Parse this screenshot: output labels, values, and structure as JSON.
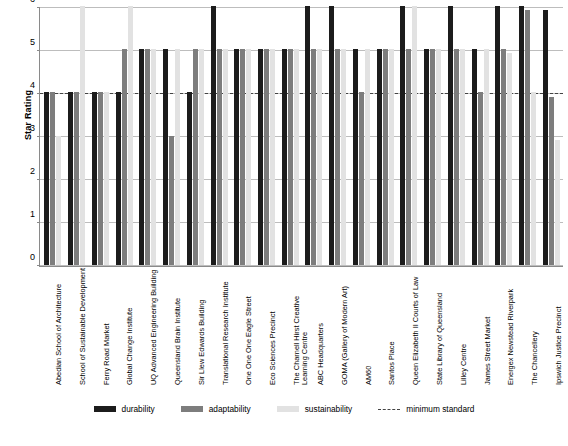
{
  "chart_data": {
    "type": "bar",
    "title": "",
    "xlabel": "",
    "ylabel": "Star Rating",
    "ylim": [
      0,
      6
    ],
    "yticks": [
      0,
      1,
      2,
      3,
      4,
      5,
      6
    ],
    "grid": true,
    "legend_position": "bottom",
    "categories": [
      "Abedian School of Architecture",
      "School of Sustainable Development",
      "Ferry Road Market",
      "Global Change Institute",
      "UQ Advanced Engineering Building",
      "Queensland Brain Institute",
      "Sir Llew Edwards Building",
      "Translational Research Institute",
      "One One One Eagle Street",
      "Eco Sciences Precinct",
      "The Charnell Hirst Creative Learning Centre",
      "ABC Headquarters",
      "GOMA (Gallery of Modern Art)",
      "AM60",
      "Santos Place",
      "Queen Elizabeth II Courts of Law",
      "State Library of Queensland",
      "Lilley Centre",
      "James Street Market",
      "Energex Newstead Riverpark",
      "The Chancellery",
      "Ipswich Justice Precinct"
    ],
    "series": [
      {
        "name": "durability",
        "color": "#1c1c1c",
        "values": [
          4,
          4,
          4,
          4,
          5,
          5,
          4,
          6,
          5,
          5,
          5,
          6,
          6,
          5,
          5,
          6,
          5,
          6,
          5,
          6,
          6,
          5.9
        ]
      },
      {
        "name": "adaptability",
        "color": "#7d7d7d",
        "values": [
          4,
          4,
          4,
          5,
          5,
          3,
          5,
          5,
          5,
          5,
          5,
          5,
          5,
          4,
          5,
          5,
          5,
          5,
          4,
          5,
          5.9,
          3.9
        ]
      },
      {
        "name": "sustainability",
        "color": "#e2e2e2",
        "values": [
          3,
          6,
          4,
          6,
          5,
          5,
          5,
          5,
          5,
          5,
          5,
          5,
          5,
          5,
          5,
          6,
          5,
          5,
          5,
          4.9,
          4,
          2.9
        ]
      }
    ],
    "reference_line": {
      "name": "minimum standard",
      "value": 4,
      "style": "dashed",
      "color": "#444444"
    }
  },
  "legend": {
    "items": [
      {
        "label": "durability",
        "swatch": "durability"
      },
      {
        "label": "adaptability",
        "swatch": "adaptability"
      },
      {
        "label": "sustainability",
        "swatch": "sustainability"
      },
      {
        "label": "minimum standard",
        "swatch": "dashed"
      }
    ]
  }
}
